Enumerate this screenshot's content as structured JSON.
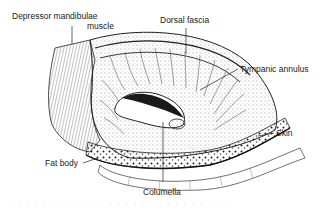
{
  "figure": {
    "labels": {
      "depressor_line1": "Depressor mandibulae",
      "depressor_line2": "muscle",
      "dorsal_fascia": "Dorsal fascia",
      "tympanic_annulus": "Tympanic annulus",
      "skin": "Skin",
      "fat_body": "Fat body",
      "columella": "Columella"
    },
    "caption_fragment": "· · ·  · · ·  · · ·  · · ·  · · ·  · · ·  · · ·  · · ·  · · ·"
  },
  "colors": {
    "ink": "#1a1a1a",
    "background": "#ffffff"
  }
}
